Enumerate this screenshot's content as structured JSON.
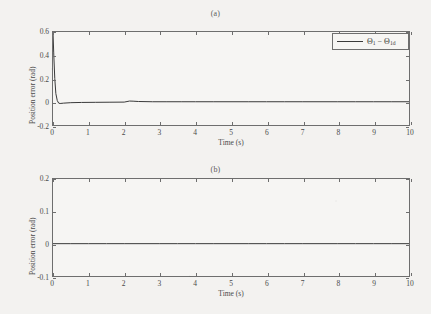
{
  "figure": {
    "background_color": "#f3f2f0",
    "line_color": "#3a3a3a",
    "axis_color": "#6e6e6e"
  },
  "panels": [
    {
      "id": "a",
      "title": "(a)",
      "xlabel": "Time (s)",
      "ylabel": "Position error (rad)",
      "xticks": [
        "0",
        "1",
        "2",
        "3",
        "4",
        "5",
        "6",
        "7",
        "8",
        "9",
        "10"
      ],
      "yticks": [
        "0.6",
        "0.4",
        "0.2",
        "0",
        "-0.2"
      ],
      "legend": {
        "symbol_1": "Θ",
        "sub_1": "1",
        "operator": "−",
        "symbol_2": "Θ",
        "sub_2": "1d",
        "full_label": "Θ₁ − Θ₁d"
      }
    },
    {
      "id": "b",
      "title": "(b)",
      "xlabel": "Time (s)",
      "ylabel": "Position error (rad)",
      "xticks": [
        "0",
        "1",
        "2",
        "3",
        "4",
        "5",
        "6",
        "7",
        "8",
        "9",
        "10"
      ],
      "yticks": [
        "0.2",
        "0.1",
        "0",
        "-0.1"
      ],
      "legend": {
        "symbol_1": "Θ",
        "sub_1": "2",
        "operator": "−",
        "symbol_2": "Θ",
        "sub_2": "2d",
        "full_label": "Θ₂ − Θ₂d"
      }
    }
  ],
  "chart_data": [
    {
      "type": "line",
      "title": "(a)",
      "xlabel": "Time (s)",
      "ylabel": "Position error (rad)",
      "xlim": [
        0,
        10
      ],
      "ylim": [
        -0.2,
        0.6
      ],
      "xticks": [
        0,
        1,
        2,
        3,
        4,
        5,
        6,
        7,
        8,
        9,
        10
      ],
      "yticks": [
        -0.2,
        0,
        0.2,
        0.4,
        0.6
      ],
      "grid": false,
      "legend_position": "upper right",
      "series": [
        {
          "name": "Θ₁ − Θ₁d",
          "color": "#3a3a3a",
          "x": [
            0,
            0.02,
            0.05,
            0.08,
            0.12,
            0.16,
            0.2,
            0.3,
            0.5,
            0.8,
            1.2,
            1.6,
            2.0,
            2.15,
            2.25,
            2.4,
            2.8,
            3.2,
            3.6,
            4.0,
            4.5,
            5.0,
            5.5,
            6.0,
            6.5,
            7.0,
            7.5,
            8.0,
            8.5,
            9.0,
            9.5,
            10
          ],
          "y": [
            0.6,
            0.42,
            0.2,
            0.07,
            0.01,
            -0.012,
            -0.015,
            -0.012,
            -0.008,
            -0.006,
            -0.005,
            -0.004,
            -0.003,
            0.006,
            0.005,
            0.002,
            0.0,
            0.0,
            0.0,
            0.0,
            0.0,
            0.0,
            0.0,
            0.0,
            0.0,
            0.0,
            0.0,
            0.0,
            0.0,
            0.0,
            0.0,
            0.0
          ]
        }
      ]
    },
    {
      "type": "line",
      "title": "(b)",
      "xlabel": "Time (s)",
      "ylabel": "Position error (rad)",
      "xlim": [
        0,
        10
      ],
      "ylim": [
        -0.1,
        0.2
      ],
      "xticks": [
        0,
        1,
        2,
        3,
        4,
        5,
        6,
        7,
        8,
        9,
        10
      ],
      "yticks": [
        -0.1,
        0,
        0.1,
        0.2
      ],
      "grid": false,
      "legend_position": "upper right",
      "series": [
        {
          "name": "Θ₂ − Θ₂d",
          "color": "#3a3a3a",
          "x": [
            0,
            0.5,
            1,
            1.5,
            2,
            2.5,
            3,
            3.5,
            4,
            4.5,
            5,
            5.5,
            6,
            6.5,
            7,
            7.5,
            8,
            8.5,
            9,
            9.5,
            10
          ],
          "y": [
            0,
            0,
            0,
            0,
            0,
            0,
            0,
            0,
            0,
            0,
            0,
            0,
            0,
            0,
            0,
            0,
            0,
            0,
            0,
            0,
            0
          ]
        }
      ]
    }
  ]
}
